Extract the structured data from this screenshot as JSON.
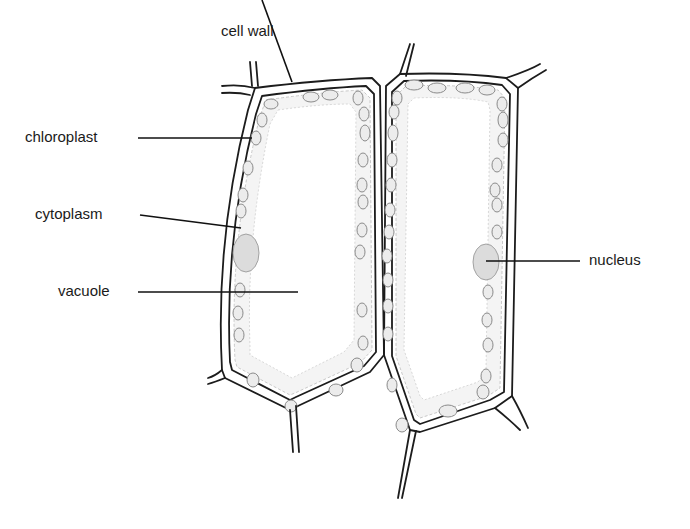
{
  "diagram": {
    "labels": {
      "cell_wall": "cell wall",
      "chloroplast": "chloroplast",
      "cytoplasm": "cytoplasm",
      "vacuole": "vacuole",
      "nucleus": "nucleus"
    },
    "colors": {
      "outline": "#1c1c1c",
      "cytoplasm": "#f4f4f4",
      "chloroplast": "#ececec",
      "nucleus": "#dcdcdc",
      "background": "#ffffff"
    },
    "structures": [
      "cell wall",
      "cytoplasm",
      "chloroplasts",
      "vacuole",
      "nucleus"
    ],
    "cell_count": 2
  }
}
